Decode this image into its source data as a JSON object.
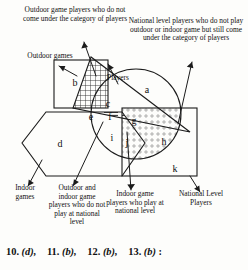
{
  "diagram": {
    "title_hidden": "",
    "annotations": {
      "outdoor_not_players": "Outdoor game players who do not come under the category of players",
      "national_not_games": "National level players who do not play outdoor or indoor game but still come under the category of players",
      "outdoor_games": "Outdoor games",
      "players": "Players",
      "indoor_games": "Indoor games",
      "outdoor_indoor_not_national": "Outdoor and indoor game players who do not play at national level",
      "indoor_national": "Indoor game players who play at national level",
      "national_level_players": "National Level Players"
    },
    "region_labels": {
      "a": "a",
      "b": "b",
      "c": "c",
      "d": "d",
      "e": "e",
      "f": "f",
      "g": "g",
      "h": "h",
      "i": "i",
      "j": "j",
      "k": "k"
    },
    "colors": {
      "stroke": "#1b1b1b",
      "background": "#fdfdfb",
      "grid_hatch": "#2a2a2a",
      "dot_fill": "#8f8f8f",
      "line_hatch": "#303030"
    }
  },
  "answers": {
    "items": [
      {
        "num": "10.",
        "choice": "(d),",
        "tail": ""
      },
      {
        "num": "11.",
        "choice": "(b),",
        "tail": ""
      },
      {
        "num": "12.",
        "choice": "(b),",
        "tail": ""
      },
      {
        "num": "13.",
        "choice": "(b)",
        "tail": ":"
      }
    ]
  }
}
